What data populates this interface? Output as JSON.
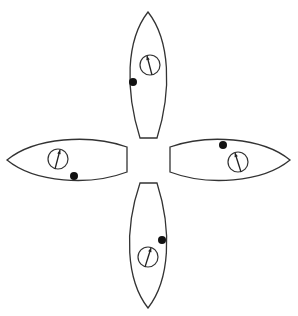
{
  "diagram": {
    "colors": {
      "stroke": "#333333",
      "fill": "#ffffff",
      "dot": "#111111"
    },
    "boats": [
      {
        "id": "top",
        "orientation": "bow-up",
        "hull_path": "M148,12 C170,40 172,90 157,138 L140,138 C125,90 126,40 148,12 Z",
        "compass": {
          "cx": 150,
          "cy": 65,
          "r": 10,
          "needle_from": [
            152,
            75
          ],
          "needle_to": [
            147,
            56
          ]
        },
        "dot": {
          "cx": 133,
          "cy": 82,
          "r": 4
        }
      },
      {
        "id": "left",
        "orientation": "bow-left",
        "hull_path": "M7,160 C35,137 90,134 127,147 L127,172 C90,186 35,183 7,160 Z",
        "compass": {
          "cx": 58,
          "cy": 159,
          "r": 10,
          "needle_from": [
            55,
            169
          ],
          "needle_to": [
            60,
            150
          ]
        },
        "dot": {
          "cx": 74,
          "cy": 176,
          "r": 4
        }
      },
      {
        "id": "right",
        "orientation": "bow-right",
        "hull_path": "M290,160 C262,137 207,134 170,147 L170,172 C207,186 262,183 290,160 Z",
        "compass": {
          "cx": 238,
          "cy": 162,
          "r": 10,
          "needle_from": [
            241,
            172
          ],
          "needle_to": [
            235,
            153
          ]
        },
        "dot": {
          "cx": 223,
          "cy": 145,
          "r": 4
        }
      },
      {
        "id": "bottom",
        "orientation": "bow-down",
        "hull_path": "M148,308 C126,280 124,230 140,183 L157,183 C172,230 170,280 148,308 Z",
        "compass": {
          "cx": 148,
          "cy": 257,
          "r": 10,
          "needle_from": [
            145,
            267
          ],
          "needle_to": [
            151,
            248
          ]
        },
        "dot": {
          "cx": 162,
          "cy": 240,
          "r": 4
        }
      }
    ]
  }
}
